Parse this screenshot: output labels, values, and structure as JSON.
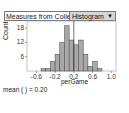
{
  "header": {
    "collection_title": "Measures from Colle",
    "graph_type": "Histogram",
    "dropdown_icon": "triangle-down-icon"
  },
  "plot": {
    "ylabel": "Count",
    "xlabel": "perGame",
    "mean_text": "mean (  ) = 0.20"
  },
  "colors": {
    "bar_fill": "#a8a8a8",
    "bar_stroke": "#444444",
    "mean_line": "#333333",
    "dropdown_bg": "#d6d6d6"
  },
  "chart_data": {
    "type": "bar",
    "title": "",
    "xlabel": "perGame",
    "ylabel": "Count",
    "bin_width": 0.1,
    "bin_starts": [
      -0.5,
      -0.4,
      -0.3,
      -0.2,
      -0.1,
      0.0,
      0.1,
      0.2,
      0.3,
      0.4,
      0.5,
      0.6,
      0.7
    ],
    "values": [
      1,
      1,
      4,
      7,
      12,
      19,
      13,
      11,
      13,
      7,
      2,
      4,
      1
    ],
    "xlim": [
      -0.8,
      1.1
    ],
    "ylim": [
      0,
      21
    ],
    "xticks": [
      "-0.6",
      "-0.2",
      "0.2",
      "0.6",
      "1.0"
    ],
    "yticks": [
      "6",
      "12",
      "18"
    ],
    "mean_line_x": 0.2,
    "grid": false
  }
}
